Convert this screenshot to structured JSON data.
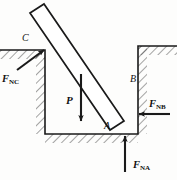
{
  "figure": {
    "type": "free-body-diagram",
    "stroke_color": "#1a1a1a",
    "hatch_color": "#444444",
    "background": "#fdfdfc"
  },
  "points": {
    "c": {
      "label": "C",
      "x": 22,
      "y": 38
    },
    "a": {
      "label": "A",
      "x": 104,
      "y": 126
    },
    "b": {
      "label": "B",
      "x": 130,
      "y": 79
    }
  },
  "forces": {
    "f_nc": {
      "symbol": "F",
      "subscript": "NC",
      "label_x": 2,
      "label_y": 74,
      "direction": "up-right toward C"
    },
    "f_nb": {
      "symbol": "F",
      "subscript": "NB",
      "label_x": 149,
      "label_y": 99,
      "direction": "right-pointing, horizontal at B"
    },
    "f_na": {
      "symbol": "F",
      "subscript": "NA",
      "label_x": 133,
      "label_y": 160,
      "direction": "upward, vertical at A"
    },
    "weight": {
      "symbol": "P",
      "label_x": 66,
      "label_y": 95,
      "direction": "downward, weight of bar"
    }
  },
  "geometry": {
    "left_ground_y": 50,
    "ditch_floor_y": 134,
    "ditch_left_wall_x": 45,
    "ditch_right_wall_x": 138,
    "right_ground_y": 46,
    "bar_angle_deg": 40
  }
}
